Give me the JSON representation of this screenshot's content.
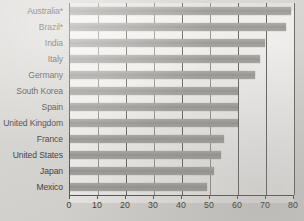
{
  "chart_data": {
    "type": "bar",
    "orientation": "horizontal",
    "title": "",
    "subtitle": "",
    "xlabel": "",
    "ylabel": "",
    "xlim": [
      0,
      80
    ],
    "xticks": [
      0,
      10,
      20,
      30,
      40,
      50,
      60,
      70,
      80
    ],
    "xtick_labels": [
      "0",
      "10",
      "20",
      "30",
      "40",
      "50",
      "60",
      "70",
      "80"
    ],
    "grid": true,
    "grid_axis": "x",
    "legend": false,
    "categories": [
      "Australia*",
      "Brazil*",
      "India",
      "Italy",
      "Germany",
      "South Korea",
      "Spain",
      "United Kingdom",
      "France",
      "United States",
      "Japan",
      "Mexico"
    ],
    "values": [
      79,
      77,
      69.5,
      68,
      66,
      60,
      60,
      60,
      55,
      54,
      51.5,
      49
    ],
    "bar_color": "#989690",
    "plot_background": "#e4e2de",
    "figure_background": "#d7d5d1",
    "axis_color": "#46443f"
  }
}
